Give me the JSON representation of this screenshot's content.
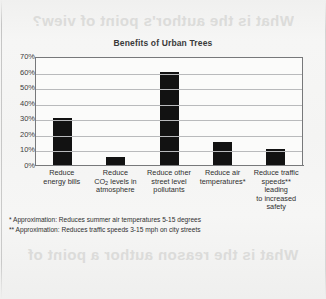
{
  "page": {
    "bleed_through_top": "What is the author's point of view?",
    "bleed_through_middle": "What is the central idea",
    "bleed_through_bottom": "What is the reason author a point of"
  },
  "chart_data": {
    "type": "bar",
    "title": "Benefits of Urban Trees",
    "xlabel": "",
    "ylabel": "",
    "ylim": [
      0,
      70
    ],
    "yticks": [
      "0%",
      "10%",
      "20%",
      "30%",
      "40%",
      "50%",
      "60%",
      "70%"
    ],
    "ytick_values": [
      0,
      10,
      20,
      30,
      40,
      50,
      60,
      70
    ],
    "grid": true,
    "legend": "none",
    "bar_color": "#121212",
    "plot_background": "#fbfbfa",
    "grid_color": "#b9babc",
    "categories": [
      "Reduce energy bills",
      "Reduce CO2 levels in atmosphere",
      "Reduce other street level pollutants",
      "Reduce air temperatures*",
      "Reduce traffic speeds** leading to increased safety"
    ],
    "category_lines": [
      [
        "Reduce",
        "energy bills"
      ],
      [
        "Reduce",
        "CO|2| levels in",
        "atmosphere"
      ],
      [
        "Reduce other",
        "street level",
        "pollutants"
      ],
      [
        "Reduce air",
        "temperatures*"
      ],
      [
        "Reduce traffic",
        "speeds** leading",
        "to increased",
        "safety"
      ]
    ],
    "values": [
      30,
      5,
      60,
      15,
      10
    ],
    "annotations": [
      "* Approximation: Reduces summer air temperatures 5-15 degrees",
      "** Approximation: Reduces traffic speeds 3-15 mph on city streets"
    ]
  }
}
